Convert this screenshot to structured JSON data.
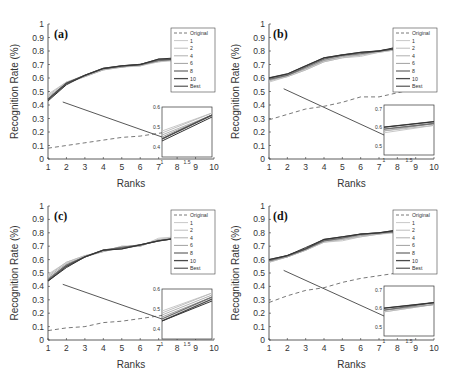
{
  "figure": {
    "ylabel": "Recognition Rate (%)",
    "xlabel": "Ranks"
  },
  "chart_data": [
    {
      "type": "line",
      "panel": "(a)",
      "xlabel": "Ranks",
      "ylabel": "Recognition Rate (%)",
      "xlim": [
        1,
        10
      ],
      "ylim": [
        0,
        1
      ],
      "xticks": [
        1,
        2,
        3,
        4,
        5,
        6,
        7,
        8,
        9,
        10
      ],
      "yticks": [
        0,
        0.1,
        0.2,
        0.3,
        0.4,
        0.5,
        0.6,
        0.7,
        0.8,
        0.9,
        1
      ],
      "x": [
        1,
        2,
        3,
        4,
        5,
        6,
        7,
        8,
        9,
        10
      ],
      "legend": [
        "Original",
        "1",
        "2",
        "4",
        "6",
        "8",
        "10",
        "Best"
      ],
      "legend_position": "upper right",
      "series": [
        {
          "name": "Original",
          "style": "dashed",
          "values": [
            0.08,
            0.1,
            0.12,
            0.14,
            0.16,
            0.17,
            0.19,
            0.21,
            0.22,
            0.23
          ]
        },
        {
          "name": "1",
          "values": [
            0.48,
            0.57,
            0.61,
            0.66,
            0.68,
            0.69,
            0.72,
            0.73,
            0.75,
            0.77
          ]
        },
        {
          "name": "2",
          "values": [
            0.47,
            0.57,
            0.62,
            0.66,
            0.68,
            0.7,
            0.72,
            0.74,
            0.75,
            0.77
          ]
        },
        {
          "name": "4",
          "values": [
            0.46,
            0.56,
            0.61,
            0.66,
            0.69,
            0.69,
            0.73,
            0.74,
            0.75,
            0.77
          ]
        },
        {
          "name": "6",
          "values": [
            0.45,
            0.56,
            0.62,
            0.67,
            0.68,
            0.7,
            0.73,
            0.74,
            0.76,
            0.77
          ]
        },
        {
          "name": "8",
          "values": [
            0.44,
            0.56,
            0.62,
            0.67,
            0.69,
            0.7,
            0.73,
            0.74,
            0.76,
            0.78
          ]
        },
        {
          "name": "10",
          "values": [
            0.44,
            0.56,
            0.62,
            0.67,
            0.69,
            0.7,
            0.74,
            0.74,
            0.76,
            0.78
          ]
        },
        {
          "name": "Best",
          "values": [
            0.43,
            0.55,
            0.62,
            0.67,
            0.69,
            0.7,
            0.74,
            0.75,
            0.76,
            0.78
          ]
        }
      ],
      "inset": {
        "xlim": [
          1,
          2
        ],
        "ylim": [
          0.35,
          0.6
        ],
        "xticks": [
          "1",
          "1.5"
        ],
        "yticks": [
          "0.4",
          "0.5",
          "0.6"
        ]
      }
    },
    {
      "type": "line",
      "panel": "(b)",
      "xlabel": "Ranks",
      "ylabel": "Recognition Rate (%)",
      "xlim": [
        1,
        10
      ],
      "ylim": [
        0,
        1
      ],
      "xticks": [
        1,
        2,
        3,
        4,
        5,
        6,
        7,
        8,
        9,
        10
      ],
      "yticks": [
        0,
        0.1,
        0.2,
        0.3,
        0.4,
        0.5,
        0.6,
        0.7,
        0.8,
        0.9,
        1
      ],
      "x": [
        1,
        2,
        3,
        4,
        5,
        6,
        7,
        8,
        9,
        10
      ],
      "legend": [
        "Original",
        "1",
        "2",
        "4",
        "6",
        "8",
        "10",
        "Best"
      ],
      "legend_position": "upper right",
      "series": [
        {
          "name": "Original",
          "style": "dashed",
          "values": [
            0.29,
            0.33,
            0.37,
            0.39,
            0.42,
            0.46,
            0.46,
            0.49,
            0.52,
            0.54
          ]
        },
        {
          "name": "1",
          "values": [
            0.57,
            0.61,
            0.66,
            0.72,
            0.75,
            0.76,
            0.79,
            0.81,
            0.83,
            0.85
          ]
        },
        {
          "name": "2",
          "values": [
            0.58,
            0.61,
            0.66,
            0.72,
            0.75,
            0.77,
            0.79,
            0.81,
            0.83,
            0.85
          ]
        },
        {
          "name": "4",
          "values": [
            0.58,
            0.62,
            0.67,
            0.73,
            0.76,
            0.77,
            0.8,
            0.82,
            0.83,
            0.85
          ]
        },
        {
          "name": "6",
          "values": [
            0.59,
            0.62,
            0.67,
            0.73,
            0.76,
            0.78,
            0.8,
            0.82,
            0.84,
            0.86
          ]
        },
        {
          "name": "8",
          "values": [
            0.59,
            0.62,
            0.68,
            0.74,
            0.77,
            0.78,
            0.8,
            0.82,
            0.84,
            0.86
          ]
        },
        {
          "name": "10",
          "values": [
            0.6,
            0.63,
            0.69,
            0.75,
            0.77,
            0.79,
            0.8,
            0.82,
            0.84,
            0.86
          ]
        },
        {
          "name": "Best",
          "values": [
            0.6,
            0.63,
            0.69,
            0.75,
            0.77,
            0.79,
            0.8,
            0.83,
            0.84,
            0.86
          ]
        }
      ],
      "inset": {
        "xlim": [
          1,
          2
        ],
        "ylim": [
          0.45,
          0.72
        ],
        "xticks": [
          "1",
          "1.5"
        ],
        "yticks": [
          "0.5",
          "0.6",
          "0.7"
        ]
      }
    },
    {
      "type": "line",
      "panel": "(c)",
      "xlabel": "Ranks",
      "ylabel": "Recognition Rate (%)",
      "xlim": [
        1,
        10
      ],
      "ylim": [
        0,
        1
      ],
      "xticks": [
        1,
        2,
        3,
        4,
        5,
        6,
        7,
        8,
        9,
        10
      ],
      "yticks": [
        0,
        0.1,
        0.2,
        0.3,
        0.4,
        0.5,
        0.6,
        0.7,
        0.8,
        0.9,
        1
      ],
      "x": [
        1,
        2,
        3,
        4,
        5,
        6,
        7,
        8,
        9,
        10
      ],
      "legend": [
        "Original",
        "1",
        "2",
        "4",
        "6",
        "8",
        "10",
        "Best"
      ],
      "legend_position": "upper right",
      "series": [
        {
          "name": "Original",
          "style": "dashed",
          "values": [
            0.07,
            0.09,
            0.1,
            0.13,
            0.14,
            0.16,
            0.18,
            0.2,
            0.21,
            0.23
          ]
        },
        {
          "name": "1",
          "values": [
            0.49,
            0.58,
            0.63,
            0.66,
            0.7,
            0.7,
            0.76,
            0.77,
            0.77,
            0.78
          ]
        },
        {
          "name": "2",
          "values": [
            0.48,
            0.58,
            0.63,
            0.66,
            0.7,
            0.7,
            0.75,
            0.76,
            0.77,
            0.78
          ]
        },
        {
          "name": "4",
          "values": [
            0.47,
            0.57,
            0.62,
            0.66,
            0.69,
            0.7,
            0.75,
            0.76,
            0.77,
            0.78
          ]
        },
        {
          "name": "6",
          "values": [
            0.46,
            0.56,
            0.62,
            0.67,
            0.69,
            0.71,
            0.74,
            0.76,
            0.77,
            0.78
          ]
        },
        {
          "name": "8",
          "values": [
            0.45,
            0.56,
            0.62,
            0.67,
            0.69,
            0.71,
            0.74,
            0.76,
            0.77,
            0.78
          ]
        },
        {
          "name": "10",
          "values": [
            0.44,
            0.55,
            0.62,
            0.67,
            0.68,
            0.71,
            0.74,
            0.76,
            0.77,
            0.78
          ]
        },
        {
          "name": "Best",
          "values": [
            0.44,
            0.54,
            0.62,
            0.67,
            0.68,
            0.71,
            0.74,
            0.76,
            0.77,
            0.78
          ]
        }
      ],
      "inset": {
        "xlim": [
          1,
          2
        ],
        "ylim": [
          0.35,
          0.6
        ],
        "xticks": [
          "1",
          "1.5"
        ],
        "yticks": [
          "0.4",
          "0.5",
          "0.6"
        ]
      }
    },
    {
      "type": "line",
      "panel": "(d)",
      "xlabel": "Ranks",
      "ylabel": "Recognition Rate (%)",
      "xlim": [
        1,
        10
      ],
      "ylim": [
        0,
        1
      ],
      "xticks": [
        1,
        2,
        3,
        4,
        5,
        6,
        7,
        8,
        9,
        10
      ],
      "yticks": [
        0,
        0.1,
        0.2,
        0.3,
        0.4,
        0.5,
        0.6,
        0.7,
        0.8,
        0.9,
        1
      ],
      "x": [
        1,
        2,
        3,
        4,
        5,
        6,
        7,
        8,
        9,
        10
      ],
      "legend": [
        "Original",
        "1",
        "2",
        "4",
        "6",
        "8",
        "10",
        "Best"
      ],
      "legend_position": "upper right",
      "series": [
        {
          "name": "Original",
          "style": "dashed",
          "values": [
            0.28,
            0.33,
            0.37,
            0.39,
            0.43,
            0.46,
            0.48,
            0.5,
            0.51,
            0.53
          ]
        },
        {
          "name": "1",
          "values": [
            0.58,
            0.62,
            0.67,
            0.73,
            0.74,
            0.77,
            0.79,
            0.8,
            0.83,
            0.86
          ]
        },
        {
          "name": "2",
          "values": [
            0.58,
            0.62,
            0.67,
            0.73,
            0.75,
            0.77,
            0.79,
            0.81,
            0.83,
            0.86
          ]
        },
        {
          "name": "4",
          "values": [
            0.59,
            0.62,
            0.67,
            0.74,
            0.75,
            0.78,
            0.79,
            0.81,
            0.83,
            0.86
          ]
        },
        {
          "name": "6",
          "values": [
            0.59,
            0.62,
            0.68,
            0.74,
            0.76,
            0.78,
            0.8,
            0.81,
            0.84,
            0.86
          ]
        },
        {
          "name": "8",
          "values": [
            0.59,
            0.63,
            0.68,
            0.74,
            0.76,
            0.79,
            0.8,
            0.81,
            0.84,
            0.86
          ]
        },
        {
          "name": "10",
          "values": [
            0.6,
            0.63,
            0.68,
            0.75,
            0.77,
            0.79,
            0.8,
            0.82,
            0.84,
            0.86
          ]
        },
        {
          "name": "Best",
          "values": [
            0.6,
            0.63,
            0.69,
            0.75,
            0.77,
            0.79,
            0.8,
            0.82,
            0.84,
            0.86
          ]
        }
      ],
      "inset": {
        "xlim": [
          1,
          2
        ],
        "ylim": [
          0.45,
          0.72
        ],
        "xticks": [
          "1",
          "1.5"
        ],
        "yticks": [
          "0.5",
          "0.6",
          "0.7"
        ]
      }
    }
  ],
  "colors": {
    "Original": "#555555",
    "1": "#c8c8c8",
    "2": "#bdbdbd",
    "4": "#b0b0b0",
    "6": "#a0a0a0",
    "8": "#707070",
    "10": "#4a4a4a",
    "Best": "#333333",
    "axis": "#333333"
  }
}
